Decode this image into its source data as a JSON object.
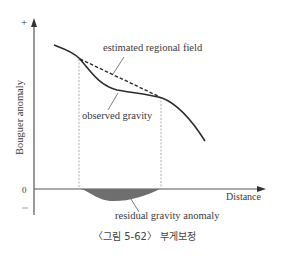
{
  "figure": {
    "y_axis_label": "Bouguer anomaly",
    "x_axis_label": "Distance",
    "plus_sign": "+",
    "zero_tick": "0",
    "minus_sign": "−",
    "label_regional": "estimated regional field",
    "label_observed": "observed gravity",
    "label_residual": "residual gravity anomaly",
    "caption": "〈그림 5-62〉 부게보정"
  },
  "colors": {
    "curve": "#2b2b2b",
    "axis": "#555555",
    "residual_fill": "#6e6e6e",
    "guide_lines": "#9a9a9a"
  }
}
